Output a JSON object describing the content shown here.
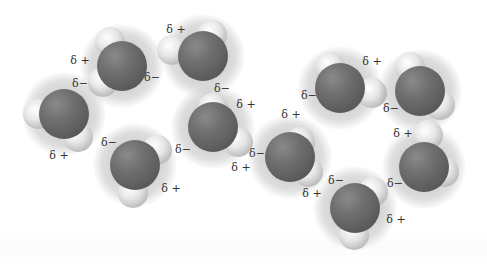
{
  "figure": {
    "colors": {
      "oxygen": "#5c5c5c",
      "hydrogen": "#e6e6e6",
      "glow": "#a0a0a0",
      "label": "#333333"
    },
    "molecules": [
      {
        "o": [
          122,
          66
        ],
        "h": [
          [
            110,
            42
          ],
          [
            103,
            82
          ]
        ]
      },
      {
        "o": [
          203,
          56
        ],
        "h": [
          [
            172,
            50
          ],
          [
            212,
            35
          ]
        ]
      },
      {
        "o": [
          64,
          114
        ],
        "h": [
          [
            38,
            114
          ],
          [
            78,
            137
          ]
        ]
      },
      {
        "o": [
          135,
          165
        ],
        "h": [
          [
            157,
            150
          ],
          [
            133,
            193
          ]
        ]
      },
      {
        "o": [
          213,
          127
        ],
        "h": [
          [
            213,
            108
          ],
          [
            238,
            142
          ]
        ]
      },
      {
        "o": [
          290,
          157
        ],
        "h": [
          [
            300,
            142
          ],
          [
            308,
            172
          ]
        ]
      },
      {
        "o": [
          340,
          88
        ],
        "h": [
          [
            330,
            67
          ],
          [
            372,
            93
          ]
        ]
      },
      {
        "o": [
          420,
          91
        ],
        "h": [
          [
            410,
            67
          ],
          [
            440,
            105
          ]
        ]
      },
      {
        "o": [
          424,
          167
        ],
        "h": [
          [
            428,
            135
          ],
          [
            444,
            172
          ]
        ]
      },
      {
        "o": [
          355,
          208
        ],
        "h": [
          [
            373,
            192
          ],
          [
            354,
            235
          ]
        ]
      }
    ],
    "labels": [
      {
        "text": "δ +",
        "x": 80,
        "y": 60
      },
      {
        "text": "δ−",
        "x": 80,
        "y": 83
      },
      {
        "text": "δ−",
        "x": 152,
        "y": 77
      },
      {
        "text": "δ +",
        "x": 176,
        "y": 29
      },
      {
        "text": "δ−",
        "x": 222,
        "y": 88
      },
      {
        "text": "δ +",
        "x": 59,
        "y": 155
      },
      {
        "text": "δ−",
        "x": 109,
        "y": 142
      },
      {
        "text": "δ +",
        "x": 171,
        "y": 188
      },
      {
        "text": "δ +",
        "x": 246,
        "y": 104
      },
      {
        "text": "δ−",
        "x": 183,
        "y": 149
      },
      {
        "text": "δ +",
        "x": 241,
        "y": 167
      },
      {
        "text": "δ +",
        "x": 291,
        "y": 114
      },
      {
        "text": "δ−",
        "x": 257,
        "y": 153
      },
      {
        "text": "δ +",
        "x": 312,
        "y": 193
      },
      {
        "text": "δ +",
        "x": 372,
        "y": 61
      },
      {
        "text": "δ−",
        "x": 309,
        "y": 95
      },
      {
        "text": "δ−",
        "x": 391,
        "y": 108
      },
      {
        "text": "δ +",
        "x": 403,
        "y": 133
      },
      {
        "text": "δ−",
        "x": 395,
        "y": 183
      },
      {
        "text": "δ−",
        "x": 336,
        "y": 180
      },
      {
        "text": "δ +",
        "x": 396,
        "y": 219
      }
    ]
  }
}
